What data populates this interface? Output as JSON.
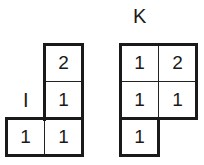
{
  "diagrams": [
    {
      "label": "I",
      "cells": [
        {
          "row": 0,
          "col": 1,
          "value": "2"
        },
        {
          "row": 1,
          "col": 1,
          "value": "1"
        },
        {
          "row": 2,
          "col": 0,
          "value": "1"
        },
        {
          "row": 2,
          "col": 1,
          "value": "1"
        }
      ]
    },
    {
      "label": "K",
      "cells": [
        {
          "row": 0,
          "col": 0,
          "value": "1"
        },
        {
          "row": 0,
          "col": 1,
          "value": "2"
        },
        {
          "row": 1,
          "col": 0,
          "value": "1"
        },
        {
          "row": 1,
          "col": 1,
          "value": "1"
        },
        {
          "row": 2,
          "col": 0,
          "value": "1"
        }
      ]
    }
  ]
}
